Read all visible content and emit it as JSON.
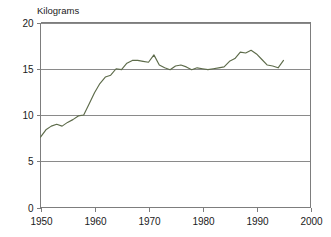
{
  "chart_data": {
    "type": "line",
    "title": "",
    "ylabel": "Kilograms",
    "xlabel": "",
    "xlim": [
      1950,
      2000
    ],
    "ylim": [
      0,
      20
    ],
    "grid": true,
    "legend": null,
    "y_ticks": [
      0,
      5,
      10,
      15,
      20
    ],
    "y_tick_labels": [
      "0",
      "5",
      "10",
      "15",
      "20"
    ],
    "x_ticks": [
      1950,
      1960,
      1970,
      1980,
      1990,
      2000
    ],
    "x_tick_labels": [
      "1950",
      "1960",
      "1970",
      "1980",
      "1990",
      "2000"
    ],
    "line_color": "#5d6b4a",
    "series": [
      {
        "name": "Kilograms",
        "x": [
          1950,
          1951,
          1952,
          1953,
          1954,
          1955,
          1956,
          1957,
          1958,
          1959,
          1960,
          1961,
          1962,
          1963,
          1964,
          1965,
          1966,
          1967,
          1968,
          1969,
          1970,
          1971,
          1972,
          1973,
          1974,
          1975,
          1976,
          1977,
          1978,
          1979,
          1980,
          1981,
          1982,
          1983,
          1984,
          1985,
          1986,
          1987,
          1988,
          1989,
          1990,
          1991,
          1992,
          1993,
          1994,
          1995
        ],
        "values": [
          7.6,
          8.4,
          8.8,
          9.0,
          8.8,
          9.2,
          9.5,
          9.9,
          10.0,
          11.2,
          12.4,
          13.4,
          14.1,
          14.3,
          15.0,
          14.9,
          15.6,
          15.9,
          15.9,
          15.8,
          15.7,
          16.5,
          15.4,
          15.1,
          14.9,
          15.3,
          15.4,
          15.2,
          14.9,
          15.1,
          15.0,
          14.9,
          15.0,
          15.1,
          15.2,
          15.8,
          16.1,
          16.8,
          16.7,
          17.0,
          16.6,
          16.0,
          15.4,
          15.3,
          15.1,
          15.9
        ]
      }
    ]
  }
}
